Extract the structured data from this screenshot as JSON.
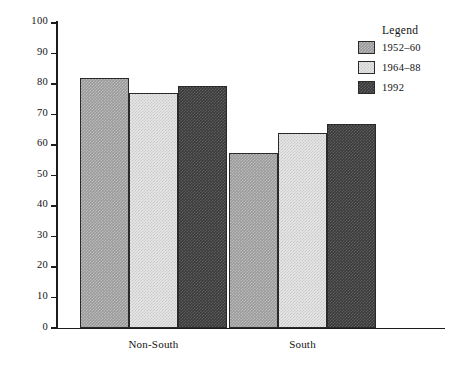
{
  "chart_data": {
    "type": "bar",
    "title": "",
    "xlabel": "",
    "ylabel": "",
    "ylim": [
      0,
      100
    ],
    "grid": false,
    "legend_position": "top-right",
    "legend_title": "Legend",
    "categories": [
      "Non-South",
      "South"
    ],
    "y_ticks": [
      0,
      10,
      20,
      30,
      40,
      50,
      60,
      70,
      80,
      90,
      100
    ],
    "y_tick_labels": [
      "0",
      "10",
      "20",
      "30",
      "40",
      "50",
      "60",
      "70",
      "80",
      "90",
      "100"
    ],
    "series": [
      {
        "name": "1952–60",
        "color": "#9a9a9a",
        "values": [
          82,
          57.5
        ]
      },
      {
        "name": "1964–88",
        "color": "#e6e6e6",
        "values": [
          77,
          64
        ]
      },
      {
        "name": "1992",
        "color": "#3a3a3a",
        "values": [
          79.5,
          67
        ]
      }
    ]
  }
}
